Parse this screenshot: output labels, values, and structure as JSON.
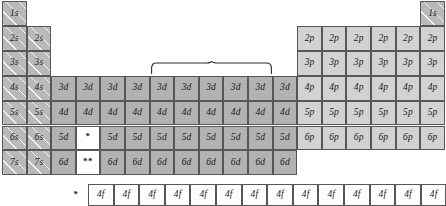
{
  "figure": {
    "type": "periodic-table-orbital-block-diagram",
    "columns": 18,
    "rows": 7,
    "colors": {
      "s_block_fill": "#b9b9b9",
      "d_block_fill": "#b2b2b2",
      "p_block_fill": "#d2d2d2",
      "f_block_fill": "#ffffff",
      "cell_border": "#575757",
      "label_color": "#1a1a1a"
    }
  },
  "blocks": {
    "s": {
      "name": "s-block",
      "column_span": [
        1,
        2
      ],
      "rows": [
        {
          "row": 1,
          "cells": [
            "1s"
          ]
        },
        {
          "row": 2,
          "cells": [
            "2s",
            "2s"
          ]
        },
        {
          "row": 3,
          "cells": [
            "3s",
            "3s"
          ]
        },
        {
          "row": 4,
          "cells": [
            "4s",
            "4s"
          ]
        },
        {
          "row": 5,
          "cells": [
            "5s",
            "5s"
          ]
        },
        {
          "row": 6,
          "cells": [
            "6s",
            "6s"
          ]
        },
        {
          "row": 7,
          "cells": [
            "7s",
            "7s"
          ]
        }
      ]
    },
    "s_helium": {
      "name": "helium-s-cell",
      "row": 1,
      "column": 18,
      "label": "1s"
    },
    "d": {
      "name": "d-block",
      "column_span": [
        3,
        12
      ],
      "rows": [
        {
          "row": 4,
          "label": "3d",
          "cells": [
            "3d",
            "3d",
            "3d",
            "3d",
            "3d",
            "3d",
            "3d",
            "3d",
            "3d",
            "3d"
          ]
        },
        {
          "row": 5,
          "label": "4d",
          "cells": [
            "4d",
            "4d",
            "4d",
            "4d",
            "4d",
            "4d",
            "4d",
            "4d",
            "4d",
            "4d"
          ]
        },
        {
          "row": 6,
          "label": "5d",
          "cells": [
            "5d",
            "5d",
            "5d",
            "5d",
            "5d",
            "5d",
            "5d",
            "5d",
            "5d",
            "5d"
          ]
        },
        {
          "row": 7,
          "label": "6d",
          "cells": [
            "6d",
            "6d",
            "6d",
            "6d",
            "6d",
            "6d",
            "6d",
            "6d",
            "6d",
            "6d"
          ]
        }
      ]
    },
    "p": {
      "name": "p-block",
      "column_span": [
        13,
        18
      ],
      "rows": [
        {
          "row": 2,
          "label": "2p",
          "cells": [
            "2p",
            "2p",
            "2p",
            "2p",
            "2p",
            "2p"
          ]
        },
        {
          "row": 3,
          "label": "3p",
          "cells": [
            "3p",
            "3p",
            "3p",
            "3p",
            "3p",
            "3p"
          ]
        },
        {
          "row": 4,
          "label": "4p",
          "cells": [
            "4p",
            "4p",
            "4p",
            "4p",
            "4p",
            "4p"
          ]
        },
        {
          "row": 5,
          "label": "5p",
          "cells": [
            "5p",
            "5p",
            "5p",
            "5p",
            "5p",
            "5p"
          ]
        },
        {
          "row": 6,
          "label": "6p",
          "cells": [
            "6p",
            "6p",
            "6p",
            "6p",
            "6p",
            "6p"
          ]
        }
      ]
    },
    "f": {
      "name": "f-block",
      "footnote_marker": "*",
      "label": "4f",
      "cells": [
        "4f",
        "4f",
        "4f",
        "4f",
        "4f",
        "4f",
        "4f",
        "4f",
        "4f",
        "4f",
        "4f",
        "4f",
        "4f",
        "4f"
      ]
    }
  },
  "footnote_markers": {
    "lanthanide_in_table": "*",
    "actinide_in_table": "**",
    "lanthanide_row": "*"
  },
  "brace": {
    "name": "transition-metal-brace",
    "orientation": "up",
    "spans_columns": [
      7,
      11
    ]
  }
}
